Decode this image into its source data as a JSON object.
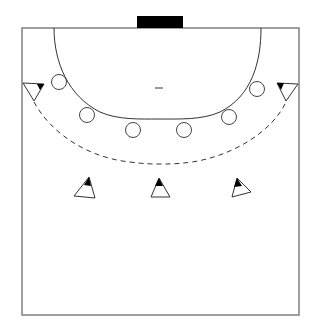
{
  "diagram": {
    "type": "handball-half-court",
    "colors": {
      "background": "#ffffff",
      "court_line": "#888888",
      "line": "#333333",
      "goal": "#000000",
      "attacker_fill": "#ffffff",
      "attacker_tip": "#000000",
      "defender_stroke": "#444444"
    },
    "court": {
      "x": 22,
      "y": 28,
      "width": 277,
      "height": 287
    },
    "goal": {
      "x": 137,
      "y": 16,
      "width": 46,
      "height": 12
    },
    "seven_meter_mark": {
      "x1": 155,
      "x2": 163,
      "y": 88
    },
    "defenders": [
      {
        "id": "d1",
        "cx": 59,
        "cy": 82,
        "r": 7.5
      },
      {
        "id": "d2",
        "cx": 87,
        "cy": 115,
        "r": 7.5
      },
      {
        "id": "d3",
        "cx": 133,
        "cy": 130,
        "r": 7.5
      },
      {
        "id": "d4",
        "cx": 184,
        "cy": 130,
        "r": 7.5
      },
      {
        "id": "d5",
        "cx": 229,
        "cy": 117,
        "r": 7.5
      },
      {
        "id": "d6",
        "cx": 257,
        "cy": 89,
        "r": 7.5
      }
    ],
    "attackers": [
      {
        "id": "left-wing",
        "points": [
          [
            23,
            83
          ],
          [
            44,
            84
          ],
          [
            34,
            101
          ]
        ],
        "tip": [
          [
            44,
            84
          ],
          [
            37,
            84
          ],
          [
            40,
            90
          ]
        ]
      },
      {
        "id": "right-wing",
        "points": [
          [
            298,
            84
          ],
          [
            277,
            83
          ],
          [
            286,
            101
          ]
        ],
        "tip": [
          [
            277,
            83
          ],
          [
            284,
            83
          ],
          [
            281,
            90
          ]
        ]
      },
      {
        "id": "left-back",
        "points": [
          [
            89,
            177
          ],
          [
            74,
            196
          ],
          [
            95,
            198
          ]
        ],
        "tip": [
          [
            89,
            177
          ],
          [
            84,
            185
          ],
          [
            91,
            186
          ]
        ]
      },
      {
        "id": "center-back",
        "points": [
          [
            159,
            178
          ],
          [
            151,
            197
          ],
          [
            170,
            197
          ]
        ],
        "tip": [
          [
            159,
            178
          ],
          [
            155,
            186
          ],
          [
            163,
            186
          ]
        ]
      },
      {
        "id": "right-back",
        "points": [
          [
            237,
            178
          ],
          [
            232,
            197
          ],
          [
            251,
            192
          ]
        ],
        "tip": [
          [
            237,
            178
          ],
          [
            234,
            187
          ],
          [
            242,
            186
          ]
        ]
      }
    ]
  }
}
